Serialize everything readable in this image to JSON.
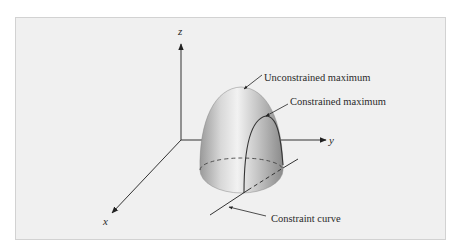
{
  "figure": {
    "type": "3d-surface-diagram",
    "axes": {
      "x_label": "x",
      "y_label": "y",
      "z_label": "z"
    },
    "annotations": {
      "unconstrained_max": "Unconstrained maximum",
      "constrained_max": "Constrained maximum",
      "constraint_curve": "Constraint curve"
    },
    "colors": {
      "background": "#f0f0f0",
      "frame_border": "#d2d2d2",
      "line": "#333333",
      "surface_light": "#e6e6e6",
      "surface_dark": "#8c8c8c"
    }
  }
}
